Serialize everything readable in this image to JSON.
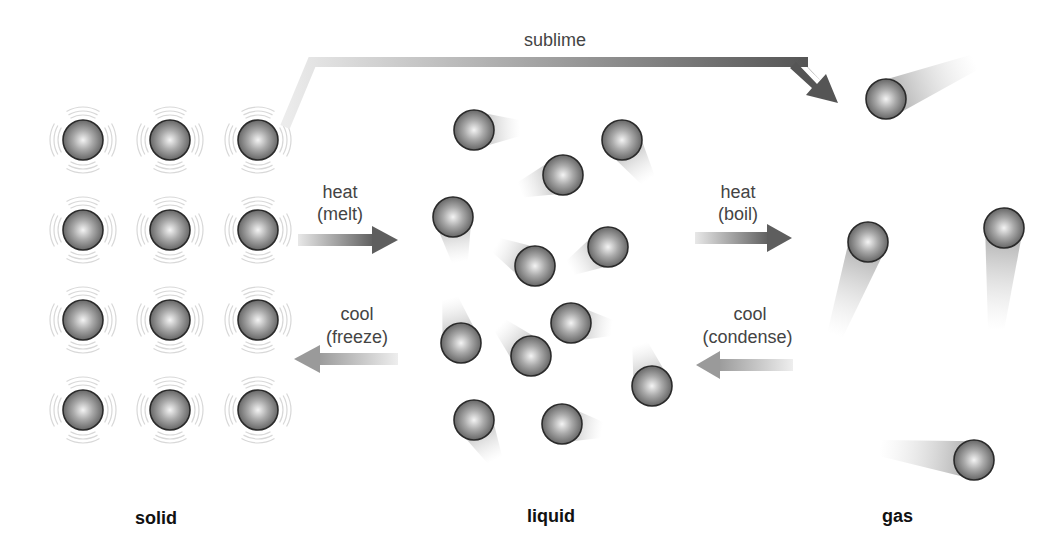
{
  "phases": {
    "solid": "solid",
    "liquid": "liquid",
    "gas": "gas"
  },
  "transitions": {
    "sublime": "sublime",
    "melt": {
      "line1": "heat",
      "line2": "(melt)"
    },
    "freeze": {
      "line1": "cool",
      "line2": "(freeze)"
    },
    "boil": {
      "line1": "heat",
      "line2": "(boil)"
    },
    "condense": {
      "line1": "cool",
      "line2": "(condense)"
    }
  },
  "colors": {
    "particle_dark": "#3a3a3a",
    "particle_light": "#f2f2f2",
    "arrow_dark": "#5a5a5a",
    "arrow_light": "#e6e6e6",
    "text": "#444444"
  },
  "particles": {
    "radius": 20,
    "solid": [
      {
        "x": 83,
        "y": 140
      },
      {
        "x": 170,
        "y": 140
      },
      {
        "x": 258,
        "y": 140
      },
      {
        "x": 83,
        "y": 230
      },
      {
        "x": 170,
        "y": 230
      },
      {
        "x": 258,
        "y": 230
      },
      {
        "x": 83,
        "y": 320
      },
      {
        "x": 170,
        "y": 320
      },
      {
        "x": 258,
        "y": 320
      },
      {
        "x": 83,
        "y": 410
      },
      {
        "x": 170,
        "y": 410
      },
      {
        "x": 258,
        "y": 410
      }
    ],
    "liquid": [
      {
        "x": 474,
        "y": 130,
        "tx": 520,
        "ty": 128
      },
      {
        "x": 622,
        "y": 140,
        "tx": 648,
        "ty": 180
      },
      {
        "x": 563,
        "y": 175,
        "tx": 520,
        "ty": 190
      },
      {
        "x": 453,
        "y": 217,
        "tx": 460,
        "ty": 262
      },
      {
        "x": 535,
        "y": 266,
        "tx": 496,
        "ty": 245
      },
      {
        "x": 608,
        "y": 247,
        "tx": 570,
        "ty": 268
      },
      {
        "x": 461,
        "y": 343,
        "tx": 450,
        "ty": 298
      },
      {
        "x": 531,
        "y": 356,
        "tx": 500,
        "ty": 325
      },
      {
        "x": 571,
        "y": 323,
        "tx": 612,
        "ty": 328
      },
      {
        "x": 652,
        "y": 386,
        "tx": 640,
        "ty": 344
      },
      {
        "x": 474,
        "y": 420,
        "tx": 495,
        "ty": 460
      },
      {
        "x": 562,
        "y": 424,
        "tx": 602,
        "ty": 430
      }
    ],
    "gas": [
      {
        "x": 886,
        "y": 99,
        "tx": 975,
        "ty": 62
      },
      {
        "x": 868,
        "y": 242,
        "tx": 835,
        "ty": 335
      },
      {
        "x": 1004,
        "y": 228,
        "tx": 996,
        "ty": 330
      },
      {
        "x": 974,
        "y": 460,
        "tx": 880,
        "ty": 448
      }
    ]
  }
}
